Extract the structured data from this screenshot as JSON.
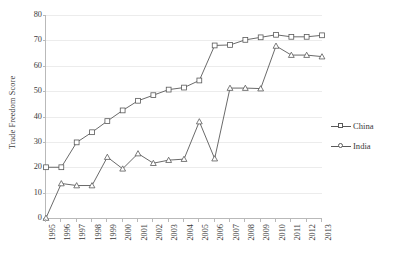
{
  "chart_data": {
    "type": "line",
    "title": "",
    "xlabel": "",
    "ylabel": "Trade Freedom Score",
    "ylim": [
      0,
      80
    ],
    "ytick_step": 10,
    "yticks": [
      0,
      10,
      20,
      30,
      40,
      50,
      60,
      70,
      80
    ],
    "grid": true,
    "legend_position": "right",
    "categories": [
      "1995",
      "1996",
      "1997",
      "1998",
      "1999",
      "2000",
      "2001",
      "2002",
      "2003",
      "2004",
      "2005",
      "2006",
      "2007",
      "2008",
      "2009",
      "2010",
      "2011",
      "2012",
      "2013"
    ],
    "series": [
      {
        "name": "China",
        "marker": "square",
        "color": "#595959",
        "values": [
          20,
          20,
          29.8,
          33.8,
          38.2,
          42.4,
          46.2,
          48.4,
          50.6,
          51.4,
          54.2,
          68,
          68.2,
          70.2,
          71.2,
          72.2,
          71.4,
          71.4,
          72
        ]
      },
      {
        "name": "India",
        "marker": "triangle",
        "color": "#595959",
        "values": [
          0,
          13.6,
          12.8,
          12.8,
          24,
          19.4,
          25.4,
          21.6,
          22.8,
          23.2,
          38,
          23.4,
          51.2,
          51.2,
          51,
          67.8,
          64.2,
          64.2,
          63.6
        ]
      }
    ]
  },
  "legend": {
    "items": [
      {
        "label": "China"
      },
      {
        "label": "India"
      }
    ]
  },
  "colors": {
    "line": "#595959",
    "grid": "#ececec",
    "axis": "#b9b9b9",
    "text": "#3a3a3a",
    "background": "#ffffff",
    "marker_fill": "#ffffff"
  }
}
